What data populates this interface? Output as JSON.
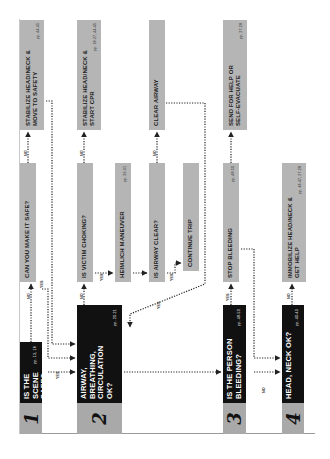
{
  "diagram": {
    "steps": [
      {
        "number": "1",
        "question": "IS THE SCENE SAFE?",
        "pages": "pp. 13, 16"
      },
      {
        "number": "2",
        "question": "AIRWAY, BREATHING, CIRCULATION OK?",
        "pages": "pp. 20-21"
      },
      {
        "number": "3",
        "question": "IS THE PERSON BLEEDING?",
        "pages": "pp. 48-50"
      },
      {
        "number": "4",
        "question": "HEAD, NECK OK?",
        "pages": "pp. 40-43"
      }
    ],
    "nodes": {
      "can_make_safe": {
        "text": "CAN  YOU MAKE IT SAFE?",
        "pages": ""
      },
      "stabilize_move": {
        "line1": "STABILIZE HEAD/NECK &",
        "line2": "MOVE TO SAFETY",
        "pages": "pp. 44-45"
      },
      "victim_choking": {
        "text": "IS VICTIM CHOKING?",
        "pages": ""
      },
      "stabilize_cpr": {
        "line1": "STABILIZE HEAD/NECK &",
        "line2": "START CPR",
        "pages": "pp. 18-27, 44-45"
      },
      "heimlich": {
        "text": "HEIMLICH MANEUVER",
        "pages": "pp. 29-31"
      },
      "airway_clear": {
        "text": "IS AIRWAY CLEAR?",
        "pages": ""
      },
      "clear_airway": {
        "text": "CLEAR AIRWAY",
        "pages": ""
      },
      "continue_trip": {
        "text": "CONTINUE TRIP",
        "pages": ""
      },
      "stop_bleeding": {
        "text": "STOP BLEEDING",
        "pages": "pp. 48-50"
      },
      "send_help": {
        "line1": "SEND FOR HELP OR",
        "line2": "SELF-EVACUATE",
        "pages": "pp. 27-28"
      },
      "immobilize": {
        "line1": "IMMOBILIZE HEAD/NECK &",
        "line2": "GET HELP",
        "pages": "pp. 46-47, 27-28"
      }
    },
    "labels": {
      "yes": "YES",
      "no": "NO"
    },
    "colors": {
      "step_box": "#111111",
      "number_box": "#a9a9a9",
      "action_box": "#b5b5b5",
      "connector": "#222222"
    }
  }
}
